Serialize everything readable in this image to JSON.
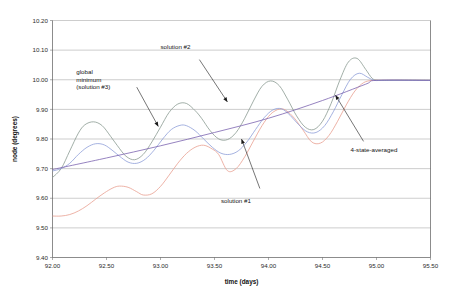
{
  "chart_data": {
    "type": "line",
    "title": "",
    "xlabel": "time (days)",
    "ylabel": "node (degrees)",
    "xlim": [
      92.0,
      95.5
    ],
    "ylim": [
      9.4,
      10.2
    ],
    "xticks": [
      "92.00",
      "92.50",
      "93.00",
      "93.50",
      "94.00",
      "94.50",
      "95.00",
      "95.50"
    ],
    "xtick_values": [
      92.0,
      92.5,
      93.0,
      93.5,
      94.0,
      94.5,
      95.0,
      95.5
    ],
    "yticks": [
      "9.40",
      "9.50",
      "9.60",
      "9.70",
      "9.80",
      "9.90",
      "10.00",
      "10.10",
      "10.20"
    ],
    "ytick_values": [
      9.4,
      9.5,
      9.6,
      9.7,
      9.8,
      9.9,
      10.0,
      10.1,
      10.2
    ],
    "grid": "horizontal",
    "legend_position": "none",
    "series": [
      {
        "name": "solution #1",
        "color": "#e8a090",
        "x": [
          92.0,
          92.08,
          92.16,
          92.24,
          92.32,
          92.4,
          92.48,
          92.56,
          92.62,
          92.7,
          92.78,
          92.84,
          92.92,
          93.0,
          93.08,
          93.16,
          93.24,
          93.32,
          93.4,
          93.48,
          93.54,
          93.62,
          93.7,
          93.78,
          93.86,
          93.94,
          94.02,
          94.1,
          94.16,
          94.24,
          94.32,
          94.4,
          94.48,
          94.56,
          94.64,
          94.72,
          94.8,
          94.88,
          94.96,
          95.04,
          95.2,
          95.5
        ],
        "y": [
          9.54,
          9.54,
          9.545,
          9.557,
          9.575,
          9.597,
          9.618,
          9.635,
          9.641,
          9.637,
          9.622,
          9.611,
          9.615,
          9.64,
          9.678,
          9.718,
          9.751,
          9.772,
          9.779,
          9.766,
          9.747,
          9.693,
          9.7,
          9.74,
          9.793,
          9.845,
          9.884,
          9.901,
          9.897,
          9.87,
          9.83,
          9.79,
          9.786,
          9.812,
          9.86,
          9.915,
          9.962,
          9.99,
          9.998,
          9.998,
          9.998,
          9.998
        ]
      },
      {
        "name": "solution #2",
        "color": "#8a9a92",
        "x": [
          92.0,
          92.08,
          92.16,
          92.24,
          92.3,
          92.38,
          92.46,
          92.54,
          92.6,
          92.68,
          92.76,
          92.84,
          92.92,
          93.0,
          93.08,
          93.16,
          93.24,
          93.32,
          93.38,
          93.46,
          93.54,
          93.62,
          93.7,
          93.78,
          93.86,
          93.94,
          94.02,
          94.1,
          94.18,
          94.26,
          94.34,
          94.42,
          94.5,
          94.58,
          94.66,
          94.74,
          94.82,
          94.9,
          94.96,
          95.02,
          95.2,
          95.5
        ],
        "y": [
          9.67,
          9.7,
          9.76,
          9.82,
          9.848,
          9.858,
          9.845,
          9.808,
          9.778,
          9.742,
          9.73,
          9.748,
          9.79,
          9.84,
          9.89,
          9.918,
          9.92,
          9.896,
          9.87,
          9.828,
          9.8,
          9.798,
          9.822,
          9.87,
          9.928,
          9.978,
          9.996,
          9.98,
          9.932,
          9.878,
          9.84,
          9.832,
          9.86,
          9.92,
          9.998,
          10.06,
          10.072,
          10.035,
          10.005,
          9.998,
          9.998,
          9.998
        ]
      },
      {
        "name": "global minimum (solution #3)",
        "color": "#8e9ed8",
        "x": [
          92.0,
          92.08,
          92.16,
          92.24,
          92.32,
          92.4,
          92.48,
          92.56,
          92.62,
          92.7,
          92.78,
          92.86,
          92.94,
          93.02,
          93.1,
          93.18,
          93.24,
          93.32,
          93.4,
          93.48,
          93.56,
          93.64,
          93.72,
          93.8,
          93.88,
          93.96,
          94.04,
          94.12,
          94.2,
          94.28,
          94.36,
          94.44,
          94.52,
          94.6,
          94.68,
          94.76,
          94.84,
          94.92,
          94.98,
          95.06,
          95.2,
          95.5
        ],
        "y": [
          9.692,
          9.7,
          9.718,
          9.748,
          9.772,
          9.784,
          9.78,
          9.76,
          9.742,
          9.722,
          9.718,
          9.732,
          9.762,
          9.8,
          9.832,
          9.846,
          9.845,
          9.828,
          9.8,
          9.772,
          9.752,
          9.748,
          9.76,
          9.79,
          9.832,
          9.872,
          9.898,
          9.902,
          9.88,
          9.848,
          9.824,
          9.822,
          9.845,
          9.892,
          9.95,
          10.002,
          10.022,
          10.008,
          9.998,
          9.998,
          9.998,
          9.998
        ]
      },
      {
        "name": "4-state-averaged",
        "color": "#7b63b0",
        "x": [
          92.0,
          92.5,
          93.0,
          93.5,
          94.0,
          94.5,
          94.9,
          95.0,
          95.5
        ],
        "y": [
          9.697,
          9.736,
          9.777,
          9.822,
          9.87,
          9.93,
          9.985,
          9.998,
          9.998
        ]
      }
    ],
    "annotations": [
      {
        "name": "global-minimum",
        "lines": [
          "global",
          "minimum",
          "(solution #3)"
        ],
        "text_x": 92.22,
        "text_y": 10.018,
        "arrow_from_x": 92.78,
        "arrow_from_y": 9.975,
        "arrow_to_x": 92.98,
        "arrow_to_y": 9.842
      },
      {
        "name": "solution-2",
        "lines": [
          "solution #2"
        ],
        "text_x": 93.0,
        "text_y": 10.104,
        "arrow_from_x": 93.36,
        "arrow_from_y": 10.068,
        "arrow_to_x": 93.62,
        "arrow_to_y": 9.925
      },
      {
        "name": "solution-1",
        "lines": [
          "solution #1"
        ],
        "text_x": 93.56,
        "text_y": 9.585,
        "arrow_from_x": 93.92,
        "arrow_from_y": 9.633,
        "arrow_to_x": 93.75,
        "arrow_to_y": 9.8
      },
      {
        "name": "4-state-averaged",
        "lines": [
          "4-state-averaged"
        ],
        "text_x": 94.76,
        "text_y": 9.755,
        "arrow_from_x": 94.88,
        "arrow_from_y": 9.792,
        "arrow_to_x": 94.62,
        "arrow_to_y": 9.948
      }
    ]
  }
}
